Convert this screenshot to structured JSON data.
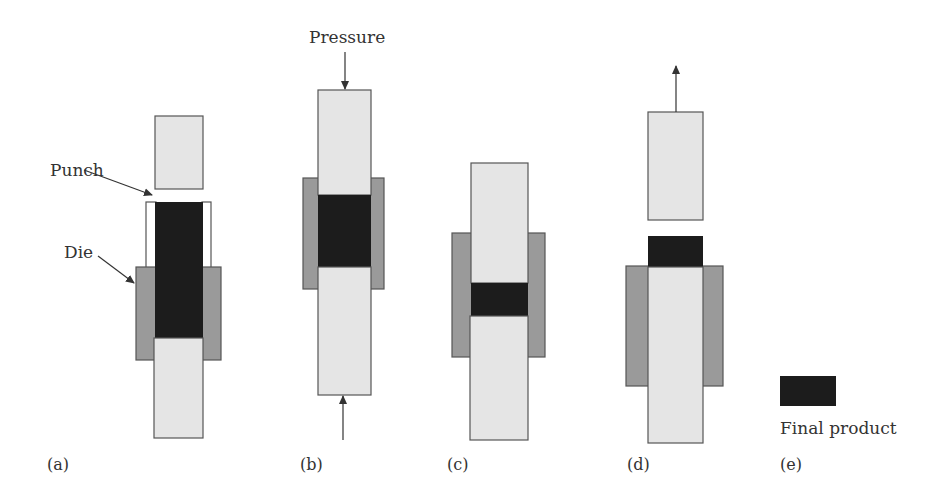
{
  "labels": {
    "punch": "Punch",
    "die": "Die",
    "pressure": "Pressure",
    "final_product": "Final product"
  },
  "panels": [
    {
      "id": "a",
      "label": "(a)"
    },
    {
      "id": "b",
      "label": "(b)"
    },
    {
      "id": "c",
      "label": "(c)"
    },
    {
      "id": "d",
      "label": "(d)"
    },
    {
      "id": "e",
      "label": "(e)"
    }
  ],
  "colors": {
    "punch": "#e5e5e5",
    "die": "#9a9a9a",
    "powder": "#1c1c1c",
    "outline": "#555555"
  }
}
